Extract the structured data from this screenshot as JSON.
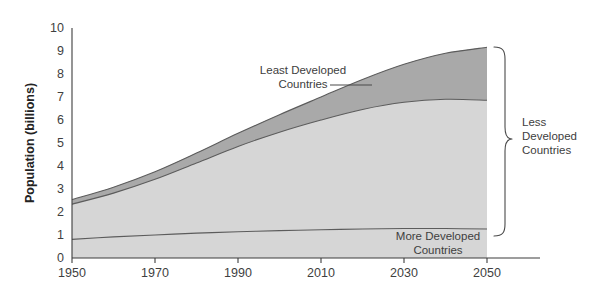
{
  "chart_data": {
    "type": "area",
    "title": "",
    "subtitle": "",
    "xlabel": "",
    "ylabel": "Population (billions)",
    "xlim": [
      1950,
      2050
    ],
    "ylim": [
      0,
      10
    ],
    "grid": false,
    "legend_position": "annotations-inline",
    "stacked": true,
    "x": [
      1950,
      1960,
      1970,
      1980,
      1990,
      2000,
      2010,
      2020,
      2030,
      2040,
      2050
    ],
    "xticks": [
      "1950",
      "1970",
      "1990",
      "2010",
      "2030",
      "2050"
    ],
    "xtick_values": [
      1950,
      1970,
      1990,
      2010,
      2030,
      2050
    ],
    "yticks": [
      "0",
      "1",
      "2",
      "3",
      "4",
      "5",
      "6",
      "7",
      "8",
      "9",
      "10"
    ],
    "ytick_values": [
      0,
      1,
      2,
      3,
      4,
      5,
      6,
      7,
      8,
      9,
      10
    ],
    "series": [
      {
        "name": "More Developed Countries",
        "color": "#d6d6d6",
        "values": [
          0.81,
          0.92,
          1.0,
          1.08,
          1.14,
          1.19,
          1.23,
          1.26,
          1.28,
          1.28,
          1.26
        ]
      },
      {
        "name": "Less Developed Countries (excluding least developed)",
        "color": "#d6d6d6",
        "values": [
          1.53,
          1.9,
          2.42,
          3.05,
          3.71,
          4.28,
          4.77,
          5.2,
          5.49,
          5.62,
          5.6
        ]
      },
      {
        "name": "Least Developed Countries",
        "color": "#a9a9a9",
        "values": [
          0.2,
          0.26,
          0.33,
          0.43,
          0.57,
          0.76,
          1.0,
          1.3,
          1.65,
          2.0,
          2.3
        ]
      }
    ],
    "cumulative_totals": [
      2.54,
      3.08,
      3.75,
      4.56,
      5.42,
      6.23,
      7.0,
      7.76,
      8.42,
      8.9,
      9.16
    ],
    "annotations": [
      {
        "name": "least-developed-countries",
        "text_lines": [
          "Least Developed",
          "Countries"
        ],
        "position": "inside-upper-left"
      },
      {
        "name": "more-developed-countries",
        "text_lines": [
          "More Developed",
          "Countries"
        ],
        "position": "inside-lower-right"
      },
      {
        "name": "less-developed-countries",
        "text_lines": [
          "Less",
          "Developed",
          "Countries"
        ],
        "position": "right-of-plot-with-brace"
      }
    ],
    "colors": {
      "light_band": "#d6d6d6",
      "dark_band": "#a9a9a9",
      "line": "#5c5c5c",
      "axis": "#3d3d3d",
      "text": "#3f3f3f",
      "background": "#ffffff"
    }
  },
  "axis": {
    "y_title": "Population (billions)"
  },
  "labels": {
    "least_developed_line1": "Least Developed",
    "least_developed_line2": "Countries",
    "more_developed_line1": "More Developed",
    "more_developed_line2": "Countries",
    "less_developed_line1": "Less",
    "less_developed_line2": "Developed",
    "less_developed_line3": "Countries"
  },
  "ticks": {
    "y": [
      "10",
      "9",
      "8",
      "7",
      "6",
      "5",
      "4",
      "3",
      "2",
      "1",
      "0"
    ],
    "x": [
      "1950",
      "1970",
      "1990",
      "2010",
      "2030",
      "2050"
    ]
  }
}
